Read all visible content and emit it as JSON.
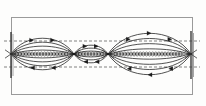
{
  "figure": {
    "title": "Magnetic island chain field-line diagram",
    "type": "line-drawing",
    "background_color": "#fdfdfc",
    "ink_color": "#1a1a1a",
    "frame_color": "#9a9a9a",
    "dashed_color": "#4a4a4a"
  },
  "frame": {
    "name": "outer-rectangle",
    "x": 11,
    "y": 17,
    "width": 181,
    "height": 77,
    "stroke_width": 1,
    "color": "#9a9a9a"
  },
  "axis": {
    "name": "horizontal-chain-axis",
    "y": 54,
    "x_start": 11,
    "x_end": 192,
    "style": "beaded-chain",
    "color": "#1a1a1a"
  },
  "dashed_lines": [
    {
      "name": "upper-separatrix-limit",
      "y": 41,
      "x_start": 4,
      "x_end": 200,
      "dash": "3 2",
      "color": "#4a4a4a"
    },
    {
      "name": "lower-separatrix-limit",
      "y": 67,
      "x_start": 4,
      "x_end": 200,
      "dash": "3 2",
      "color": "#4a4a4a"
    }
  ],
  "walls": [
    {
      "name": "left-wall-segment",
      "x": 11,
      "y_top": 32,
      "y_bottom": 78,
      "color": "#3a3a3a"
    },
    {
      "name": "right-wall-segment",
      "x": 191,
      "y_top": 31,
      "y_bottom": 79,
      "color": "#3a3a3a"
    }
  ],
  "x_points": [
    {
      "name": "x-point-left",
      "x": 11,
      "y": 54
    },
    {
      "name": "x-point-1",
      "x": 74,
      "y": 54
    },
    {
      "name": "x-point-2",
      "x": 108,
      "y": 54
    },
    {
      "name": "x-point-right",
      "x": 191,
      "y": 54
    }
  ],
  "islands": [
    {
      "name": "island-left",
      "label": "left lens",
      "x_left": 11,
      "x_right": 74,
      "center_x": 42,
      "center_y": 54,
      "nested_curves": 4,
      "max_half_height": 16,
      "arrow_count": 4
    },
    {
      "name": "island-middle",
      "label": "middle small lens",
      "x_left": 74,
      "x_right": 108,
      "center_x": 91,
      "center_y": 54,
      "nested_curves": 3,
      "max_half_height": 9,
      "arrow_count": 4
    },
    {
      "name": "island-right",
      "label": "right large lens",
      "x_left": 108,
      "x_right": 191,
      "center_x": 150,
      "center_y": 54,
      "nested_curves": 4,
      "max_half_height": 21,
      "arrow_count": 6
    }
  ],
  "arrows": {
    "name": "flow-direction-markers",
    "glyph": "chevron",
    "size": 3,
    "color": "#1a1a1a",
    "note": "small arrowheads placed along the nested closed curves indicating circulation sense"
  }
}
